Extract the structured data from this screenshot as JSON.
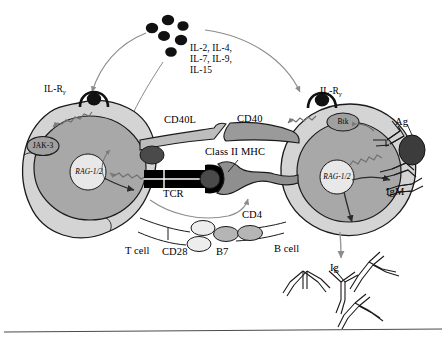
{
  "figure": {
    "background": "#ffffff",
    "width": 446,
    "height": 339,
    "baseline_rule": true
  },
  "colors": {
    "outline": "#1a1a1a",
    "cytoplasm": "#d4d4d4",
    "nucleus": "#a8a8a8",
    "nucleolus": "#e8e8e8",
    "cd40l": "#bdbdbd",
    "cd40": "#9a9a9a",
    "mhc": "#8f8f8f",
    "tcr": "#000000",
    "peptide": "#4a4a4a",
    "cytokine_dot": "#111111",
    "antigen": "#3c3c3c",
    "cd28": "#ededed",
    "b7": "#b5b5b5",
    "organelle": "#a0a0a0",
    "arrow_gray": "#8c8c8c",
    "arrow_dark": "#2b2b2b"
  },
  "cytokines": {
    "label_lines": [
      "IL-2, IL-4,",
      "IL-7, IL-9,",
      "IL-15"
    ],
    "dot_count": 6,
    "name": "cytokine-cluster"
  },
  "t_cell": {
    "name": "T cell",
    "label": "T cell",
    "receptor_label": "IL-R",
    "receptor_subscript": "γ",
    "kinase_label": "JAK-3",
    "nucleus_gene_label": "RAG-1/2"
  },
  "b_cell": {
    "name": "B cell",
    "label": "B cell",
    "receptor_label": "IL-R",
    "receptor_subscript": "γ",
    "kinase_label": "Btk",
    "nucleus_gene_label": "RAG-1/2",
    "surface_receptor_label": "IgM",
    "antigen_label": "Ag",
    "secreted_label": "Ig",
    "secreted_count": 4
  },
  "synapse": {
    "cd40l_label": "CD40L",
    "cd40_label": "CD40",
    "mhc_label": "Class II MHC",
    "tcr_label": "TCR",
    "cd4_label": "CD4",
    "cd28_label": "CD28",
    "b7_label": "B7"
  }
}
